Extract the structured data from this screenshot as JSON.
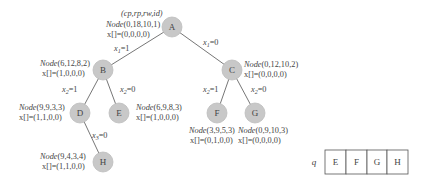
{
  "diagram": {
    "type": "search-tree",
    "header_label": "(cp,rp,rw,id)",
    "nodes": {
      "A": {
        "letter": "A",
        "node_prefix": "Node",
        "node_tuple": "(0,18,10,1)",
        "x_label": "x[]=(0,0,0,0)"
      },
      "B": {
        "letter": "B",
        "node_prefix": "Node",
        "node_tuple": "(6,12,8,2)",
        "x_label": "x[]=(1,0,0,0)"
      },
      "C": {
        "letter": "C",
        "node_prefix": "Node",
        "node_tuple": "(0,12,10,2)",
        "x_label": "x[]=(0,0,0,0)"
      },
      "D": {
        "letter": "D",
        "node_prefix": "Node",
        "node_tuple": "(9,9,3,3)",
        "x_label": "x[]=(1,1,0,0)"
      },
      "E": {
        "letter": "E",
        "node_prefix": "Node",
        "node_tuple": "(6,9,8,3)",
        "x_label": "x[]=(1,0,0,0)"
      },
      "F": {
        "letter": "F",
        "node_prefix": "Node",
        "node_tuple": "(3,9,5,3)",
        "x_label": "x[]=(0,1,0,0)"
      },
      "G": {
        "letter": "G",
        "node_prefix": "Node",
        "node_tuple": "(0,9,10,3)",
        "x_label": "x[]=(0,0,0,0)"
      },
      "H": {
        "letter": "H",
        "node_prefix": "Node",
        "node_tuple": "(9,4,3,4)",
        "x_label": "x[]=(1,1,0,0)"
      }
    },
    "edges": {
      "A_B": {
        "var": "x",
        "sub": "1",
        "val": "=1"
      },
      "A_C": {
        "var": "x",
        "sub": "1",
        "val": "=0"
      },
      "B_D": {
        "var": "x",
        "sub": "2",
        "val": "=1"
      },
      "B_E": {
        "var": "x",
        "sub": "2",
        "val": "=0"
      },
      "C_F": {
        "var": "x",
        "sub": "2",
        "val": "=1"
      },
      "C_G": {
        "var": "x",
        "sub": "2",
        "val": "=0"
      },
      "D_H": {
        "var": "x",
        "sub": "3",
        "val": "=0"
      }
    },
    "queue": {
      "label": "q",
      "items": [
        "E",
        "F",
        "G",
        "H"
      ]
    },
    "colors": {
      "node_fill": "#c8c8c8",
      "edge": "#666666",
      "text": "#444444"
    }
  }
}
